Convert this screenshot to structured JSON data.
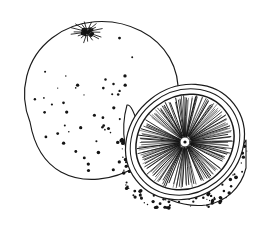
{
  "artwork": {
    "title": "Orange",
    "subject": "citrus fruit",
    "technique": "pen-and-ink line engraving",
    "palette": {
      "background": "#ffffff",
      "ink": "#1a1a1a",
      "ink_dark": "#111111",
      "paper_tint": "#fdfdfc"
    },
    "canvas": {
      "width": 256,
      "height": 230
    }
  },
  "whole_orange": {
    "label": "whole orange",
    "outline": {
      "center_x": 97,
      "center_y": 103,
      "radius_x": 78,
      "radius_y": 76,
      "stroke_width": 1.15,
      "path": "M 30 122 C 18 92 26 58 52 38 C 76 19 112 16 141 31 C 166 44 180 68 178 96 C 177 124 161 150 137 166 C 113 181 83 184 61 172 C 43 162 34 145 30 122 Z"
    },
    "calyx": {
      "label": "stem calyx",
      "center_x": 87,
      "center_y": 32,
      "core_radius": 6.0,
      "spike_count": 18,
      "spike_length": 9.5,
      "stroke_width": 0.85
    },
    "stipple": {
      "label": "peel oil-gland dots",
      "count": 118,
      "min_radius": 0.55,
      "max_radius": 1.75,
      "region_center_x": 108,
      "region_center_y": 120,
      "bias": "lower-right"
    }
  },
  "half_orange": {
    "label": "halved orange",
    "peel_body": {
      "label": "outer peel of half",
      "path": "M 127 105 C 120 130 124 158 140 178 C 156 197 182 208 206 205 C 226 202 241 188 246 168 L 246 140 C 236 160 214 173 192 172 C 168 170 148 152 140 129 C 134 113 131 104 127 105 Z",
      "stroke_width": 1.1
    },
    "cut_face": {
      "label": "cut face ellipse",
      "center_x": 185,
      "center_y": 142,
      "radius_x": 62,
      "radius_y": 55,
      "rotation_deg": -38,
      "stroke_width": 1.2
    },
    "rind": {
      "label": "rind band",
      "outer_inset": 0,
      "pith_inset": 5,
      "inner_inset": 11,
      "stroke_width": 1.0
    },
    "pulp": {
      "label": "radial pulp segments",
      "line_count": 168,
      "inner_radius_fraction": 0.1,
      "outer_radius_fraction": 0.87,
      "stroke_width": 0.62,
      "segment_count": 10,
      "segment_gap_deg": 3.0
    },
    "core": {
      "label": "central core",
      "center_x": 185,
      "center_y": 142,
      "radius": 5.0,
      "dot_radius": 1.6
    },
    "stipple": {
      "label": "half peel dots",
      "count": 86,
      "min_radius": 0.55,
      "max_radius": 1.9
    }
  },
  "composition": {
    "foreground": "half_orange",
    "background": "whole_orange",
    "overlap_note": "half orange sits in front of and right of the whole orange"
  }
}
